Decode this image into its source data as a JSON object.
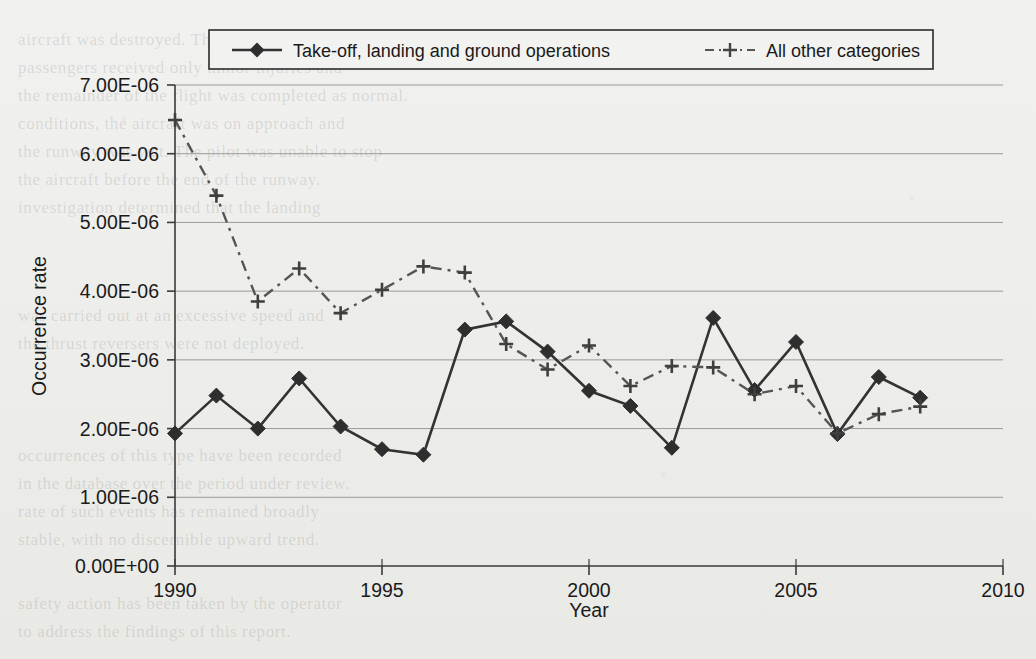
{
  "chart_data": {
    "type": "line",
    "title": "",
    "xlabel": "Year",
    "ylabel": "Occurrence rate",
    "x": [
      1990,
      1991,
      1992,
      1993,
      1994,
      1995,
      1996,
      1997,
      1998,
      1999,
      2000,
      2001,
      2002,
      2003,
      2004,
      2005,
      2006,
      2007,
      2008
    ],
    "xlim": [
      1990,
      2010
    ],
    "ylim": [
      0,
      7e-06
    ],
    "xticks": [
      1990,
      1995,
      2000,
      2005,
      2010
    ],
    "xtick_labels": [
      "1990",
      "1995",
      "2000",
      "2005",
      "2010"
    ],
    "yticks": [
      0,
      1e-06,
      2e-06,
      3e-06,
      4e-06,
      5e-06,
      6e-06,
      7e-06
    ],
    "ytick_labels": [
      "0.00E+00",
      "1.00E-06",
      "2.00E-06",
      "3.00E-06",
      "4.00E-06",
      "5.00E-06",
      "6.00E-06",
      "7.00E-06"
    ],
    "grid": "horizontal",
    "legend_position": "top-center",
    "series": [
      {
        "name": "Take-off, landing and ground operations",
        "marker": "diamond",
        "linestyle": "solid",
        "color": "#333333",
        "values": [
          1.93e-06,
          2.48e-06,
          2e-06,
          2.73e-06,
          2.03e-06,
          1.7e-06,
          1.62e-06,
          3.44e-06,
          3.56e-06,
          3.12e-06,
          2.55e-06,
          2.33e-06,
          1.72e-06,
          3.61e-06,
          2.56e-06,
          3.26e-06,
          1.92e-06,
          2.75e-06,
          2.45e-06
        ]
      },
      {
        "name": "All other categories",
        "marker": "plus",
        "linestyle": "dashdot",
        "color": "#555555",
        "values": [
          6.49e-06,
          5.39e-06,
          3.85e-06,
          4.33e-06,
          3.68e-06,
          4.02e-06,
          4.36e-06,
          4.27e-06,
          3.23e-06,
          2.86e-06,
          3.21e-06,
          2.62e-06,
          2.91e-06,
          2.89e-06,
          2.5e-06,
          2.62e-06,
          1.93e-06,
          2.21e-06,
          2.32e-06
        ]
      }
    ]
  },
  "legend": {
    "items": [
      {
        "label": "Take-off, landing and ground operations"
      },
      {
        "label": "All other categories"
      }
    ]
  },
  "background_text": {
    "lines": [
      "aircraft was destroyed. The crew and all",
      "passengers received only minor injuries and",
      "the remainder of the flight was completed as normal.",
      "conditions, the aircraft was on approach and",
      "the runway was wet. The pilot was unable to stop",
      "the aircraft before the end of the runway.",
      "investigation determined that the landing",
      "was carried out at an excessive speed and",
      "the thrust reversers were not deployed.",
      "occurrences of this type have been recorded",
      "in the database over the period under review.",
      "rate of such events has remained broadly",
      "stable, with no discernible upward trend.",
      "safety action has been taken by the operator",
      "to address the findings of this report."
    ]
  }
}
